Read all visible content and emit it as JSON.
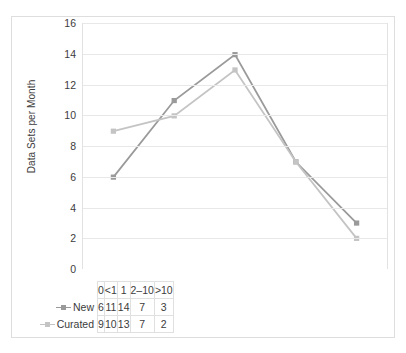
{
  "chart_data": {
    "type": "line",
    "title": "",
    "xlabel": "",
    "ylabel": "Data Sets per Month",
    "categories": [
      "0",
      "<1",
      "1",
      "2–10",
      ">10"
    ],
    "series": [
      {
        "name": "New",
        "values": [
          6,
          11,
          14,
          7,
          3
        ],
        "color": "#9a9a9a"
      },
      {
        "name": "Curated",
        "values": [
          9,
          10,
          13,
          7,
          2
        ],
        "color": "#c4c4c4"
      }
    ],
    "ylim": [
      0,
      16
    ],
    "ytick_labels": [
      "16",
      "14",
      "12",
      "10",
      "8",
      "6",
      "4",
      "2",
      "0"
    ],
    "ytick_values": [
      16,
      14,
      12,
      10,
      8,
      6,
      4,
      2,
      0
    ],
    "grid": true,
    "legend_position": "table-row-headers",
    "marker": "square"
  },
  "table": {
    "corner_label": "",
    "header": [
      "0",
      "<1",
      "1",
      "2–10",
      ">10"
    ],
    "rows": [
      {
        "label": "New",
        "values": [
          "6",
          "11",
          "14",
          "7",
          "3"
        ]
      },
      {
        "label": "Curated",
        "values": [
          "9",
          "10",
          "13",
          "7",
          "2"
        ]
      }
    ]
  },
  "colors": {
    "series_new": "#9a9a9a",
    "series_curated": "#c4c4c4",
    "gridline": "#e8e8e8",
    "frame": "#dedede",
    "text": "#3c3c3c"
  }
}
